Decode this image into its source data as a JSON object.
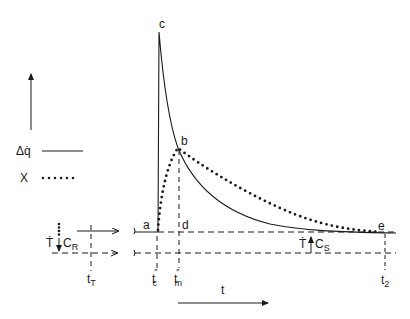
{
  "diagram": {
    "type": "heat-release-vs-time schematic",
    "ink_color": "#1a1a1a",
    "background": "#ffffff",
    "legend": {
      "items": [
        {
          "symbol": "Δq̇",
          "style": "solid-line"
        },
        {
          "symbol": "X",
          "style": "dotted-line"
        }
      ]
    },
    "points": {
      "a": "a",
      "b": "b",
      "c": "c",
      "d": "d",
      "e": "e"
    },
    "time_labels": {
      "tT": "t",
      "tT_sub": "T",
      "tc": "t",
      "tc_sub": "c",
      "tc_prime": "″",
      "tm": "t",
      "tm_sub": "m",
      "tm_prime": "″",
      "t2": "t",
      "t2_sub": "2"
    },
    "axis": {
      "t_label": "t"
    },
    "rates": {
      "cr_T": "Ṫ",
      "cr_label": "C",
      "cr_sub": "R",
      "cs_T": "Ṫ",
      "cs_label": "C",
      "cs_sub": "S"
    }
  }
}
